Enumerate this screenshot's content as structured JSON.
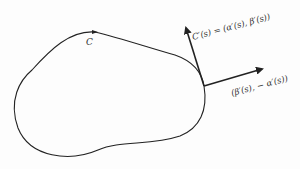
{
  "diagram": {
    "curve_label": "C",
    "tangent_label": "C′(s) = (α′(s), β′(s))",
    "normal_label": "(β′(s), − α′(s))",
    "colors": {
      "background": "#fdfdfd",
      "stroke": "#222222",
      "text": "#333333"
    }
  }
}
